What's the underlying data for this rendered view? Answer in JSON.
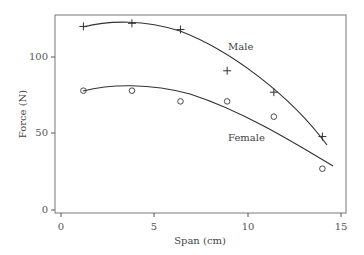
{
  "chart_data": {
    "type": "scatter",
    "title": "",
    "xlabel": "Span (cm)",
    "ylabel": "Force (N)",
    "xlim": [
      0,
      15
    ],
    "ylim": [
      0,
      125
    ],
    "x_ticks": [
      0,
      5,
      10,
      15
    ],
    "y_ticks": [
      0,
      50,
      100
    ],
    "grid": false,
    "legend_position": "inline labels",
    "series": [
      {
        "name": "Male",
        "marker": "plus",
        "x": [
          1.2,
          3.8,
          6.4,
          8.9,
          11.4,
          14.0
        ],
        "values": [
          120,
          122,
          118,
          91,
          77,
          48
        ],
        "fit_curve": true
      },
      {
        "name": "Female",
        "marker": "circle",
        "x": [
          1.2,
          3.8,
          6.4,
          8.9,
          11.4,
          14.0
        ],
        "values": [
          78,
          78,
          71,
          71,
          61,
          27
        ],
        "fit_curve": true
      }
    ]
  },
  "labels": {
    "xlabel": "Span (cm)",
    "ylabel": "Force (N)",
    "male": "Male",
    "female": "Female",
    "x_ticks": [
      "0",
      "5",
      "10",
      "15"
    ],
    "y_ticks": [
      "0",
      "50",
      "100"
    ]
  }
}
